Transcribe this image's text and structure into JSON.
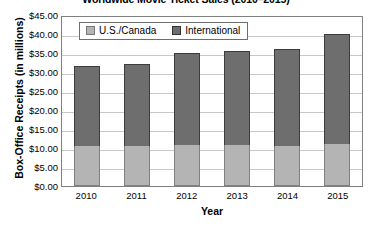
{
  "chart_data": {
    "type": "bar",
    "title": "Worldwide Movie Ticket Sales (2010–2015)",
    "xlabel": "Year",
    "ylabel": "Box-Office Receipts (in millions)",
    "categories": [
      "2010",
      "2011",
      "2012",
      "2013",
      "2014",
      "2015"
    ],
    "series": [
      {
        "name": "U.S./Canada",
        "color": "#b4b4b4",
        "values": [
          10.6,
          10.6,
          10.8,
          10.9,
          10.4,
          11.1
        ]
      },
      {
        "name": "International",
        "color": "#6e6e6e",
        "values": [
          20.9,
          21.6,
          24.2,
          24.6,
          25.6,
          28.9
        ]
      }
    ],
    "stacked": true,
    "totals": [
      31.5,
      32.2,
      35.0,
      35.5,
      36.0,
      40.0
    ],
    "ylim": [
      0,
      45
    ],
    "ytick_values": [
      45,
      40,
      35,
      30,
      25,
      20,
      15,
      10,
      5,
      0
    ],
    "ytick_labels": [
      "$45.00",
      "$40.00",
      "$35.00",
      "$30.00",
      "$25.00",
      "$20.00",
      "$15.00",
      "$10.00",
      "$5.00",
      "$0.00"
    ],
    "grid": true,
    "legend_position": "top-left-inside",
    "legend_entries": [
      "U.S./Canada",
      "International"
    ]
  }
}
